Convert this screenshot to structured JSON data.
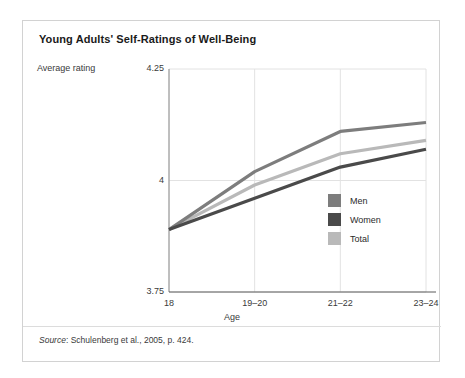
{
  "figure": {
    "title": "Young Adults' Self-Ratings of Well-Being",
    "y_axis_caption": "Average rating",
    "source_word": "Source",
    "source_text": ": Schulenberg et al., 2005, p. 424."
  },
  "colors": {
    "men": "#7d7d7d",
    "women": "#4a4a4a",
    "total": "#b9b9b9",
    "grid": "#e2e2e2",
    "axis": "#8c8c8c",
    "card_border": "#d2d2d2"
  },
  "chart_data": {
    "type": "line",
    "title": "Young Adults' Self-Ratings of Well-Being",
    "xlabel": "Age",
    "ylabel": "Average rating",
    "categories": [
      "18",
      "19–20",
      "21–22",
      "23–24"
    ],
    "yticks": [
      "3.75",
      "4",
      "4.25"
    ],
    "ytick_values": [
      3.75,
      4,
      4.25
    ],
    "ylim": [
      3.75,
      4.25
    ],
    "grid": true,
    "legend_position": "inside-right",
    "series": [
      {
        "name": "Men",
        "color": "#7d7d7d",
        "values": [
          3.89,
          4.02,
          4.11,
          4.13
        ]
      },
      {
        "name": "Women",
        "color": "#4a4a4a",
        "values": [
          3.89,
          3.96,
          4.03,
          4.07
        ]
      },
      {
        "name": "Total",
        "color": "#b9b9b9",
        "values": [
          3.89,
          3.99,
          4.06,
          4.09
        ]
      }
    ],
    "legend": [
      "Men",
      "Women",
      "Total"
    ]
  }
}
